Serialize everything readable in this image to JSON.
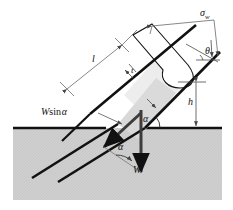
{
  "figure": {
    "type": "engineering-diagram",
    "background_color": "#ffffff",
    "ground_fill_color": "#cfcfcf",
    "chip_fill_color": "#d9d9d9",
    "line_color": "#111111",
    "dimension_line_color": "#777777"
  },
  "labels": {
    "sigma_w": {
      "text": "σ",
      "sub": "w",
      "x": 200,
      "y": 8
    },
    "theta": {
      "text": "θ",
      "x": 205,
      "y": 48
    },
    "l": {
      "text": "l",
      "x": 92,
      "y": 57
    },
    "t": {
      "text": "t",
      "x": 131,
      "y": 68
    },
    "h": {
      "text": "h",
      "x": 188,
      "y": 98
    },
    "w_sin_alpha": {
      "text": "W",
      "rom": "sin",
      "sym": "α",
      "x": 44,
      "y": 109
    },
    "alpha_surface": {
      "text": "α",
      "x": 143,
      "y": 116
    },
    "alpha_force": {
      "text": "α",
      "x": 118,
      "y": 144
    },
    "W": {
      "text": "W",
      "x": 133,
      "y": 167
    }
  },
  "geometry": {
    "ground_line_y": 128,
    "ground_left_x": 13,
    "ground_right_x": 222,
    "ground_bottom_y": 200,
    "shear_angle_deg": 40
  }
}
